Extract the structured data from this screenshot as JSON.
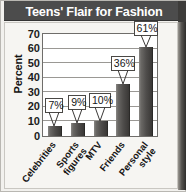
{
  "chart_data": {
    "type": "bar",
    "title": "Teens' Flair for Fashion",
    "xlabel": "",
    "ylabel": "Percent",
    "categories": [
      "Celebrities",
      "Sports figures",
      "MTV",
      "Friends",
      "Personal style"
    ],
    "category_lines": [
      [
        "Celebrities"
      ],
      [
        "Sports",
        "figures"
      ],
      [
        "MTV"
      ],
      [
        "Friends"
      ],
      [
        "Personal",
        "style"
      ]
    ],
    "values": [
      7,
      9,
      10,
      36,
      61
    ],
    "data_labels": [
      "7%",
      "9%",
      "10%",
      "36%",
      "61%"
    ],
    "ylim": [
      0,
      70
    ],
    "yticks": [
      70,
      60,
      50,
      40,
      30,
      20,
      10,
      0
    ],
    "ytick_labels": [
      "70",
      "60",
      "50",
      "40",
      "30",
      "20",
      "10",
      "0"
    ],
    "grid": true,
    "legend": false,
    "colors": {
      "bar_light": "#8a8885",
      "bar_dark": "#3a3836",
      "title_bar_bg": "#4c4c4c",
      "title_text": "#ffffff",
      "plot_bg": "#ffffff",
      "panel_bg": "#f6f5f2",
      "axis": "#6f6d6a",
      "gridline": "#9a9894",
      "label_text": "#161616"
    }
  }
}
